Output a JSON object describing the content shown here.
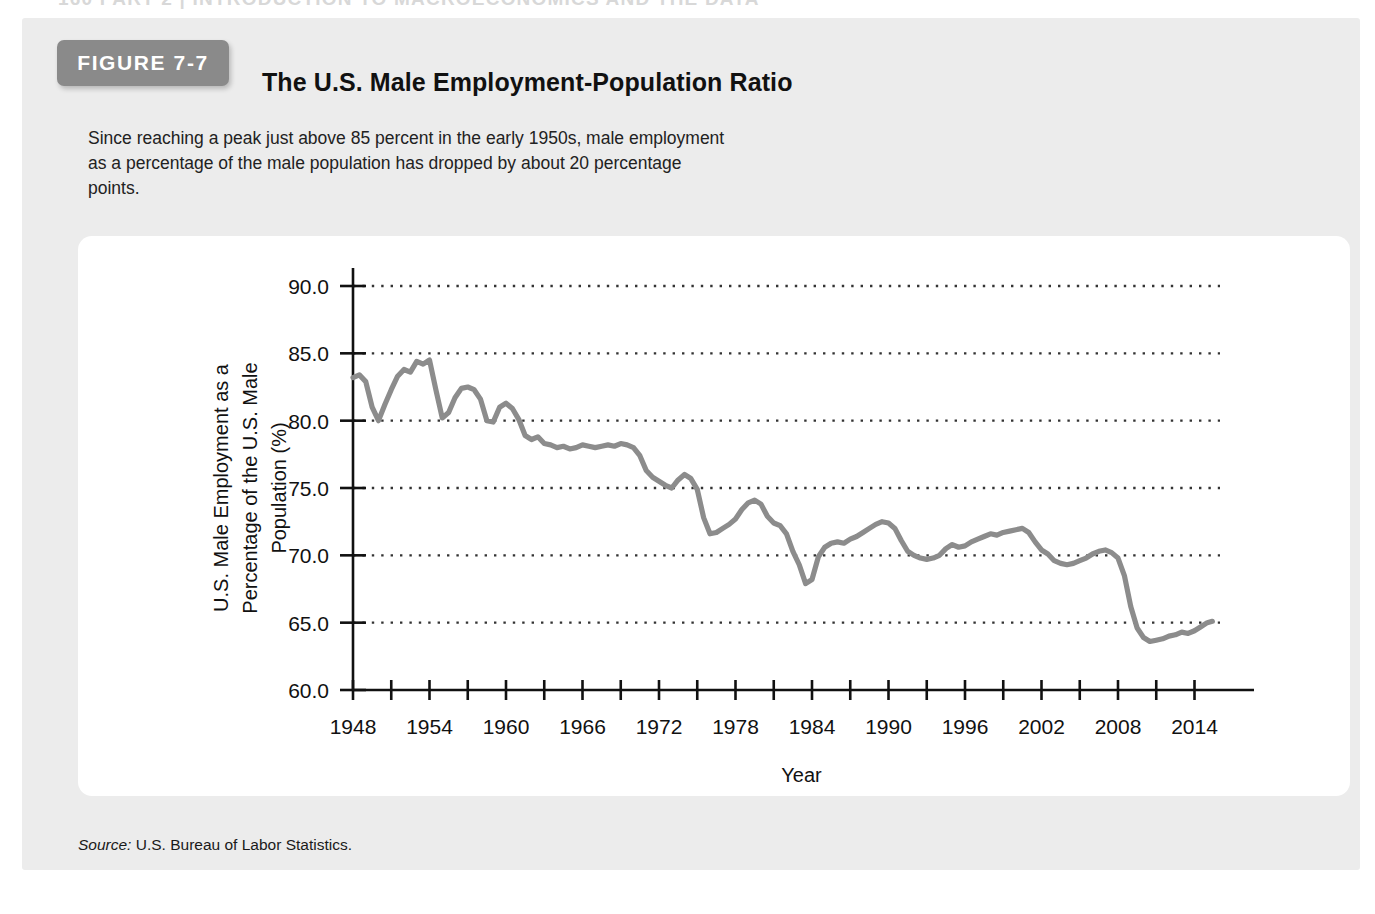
{
  "running_head": "160   PART 2  |  INTRODUCTION TO MACROECONOMICS AND THE DATA",
  "figure": {
    "badge_label": "FIGURE 7-7",
    "title": "The U.S. Male Employment-Population Ratio",
    "caption": "Since reaching a peak just above 85 percent in the early 1950s, male employment as a percentage of the male population has dropped by about 20 percentage points.",
    "source_word": "Source:",
    "source_text": " U.S. Bureau of Labor Statistics."
  },
  "colors": {
    "panel_background": "#ececec",
    "badge": "#8a8a8a",
    "card": "#ffffff",
    "line": "#8c8c8c",
    "axis": "#111111",
    "gridline": "#333333"
  },
  "chart_data": {
    "type": "line",
    "title": "The U.S. Male Employment-Population Ratio",
    "xlabel": "Year",
    "ylabel": "U.S. Male Employment as a Percentage of the U.S. Male Population (%)",
    "ylabel_lines": [
      "U.S. Male Employment as a",
      "Percentage of the U.S. Male",
      "Population (%)"
    ],
    "xlim": [
      1948,
      2016
    ],
    "ylim": [
      60.0,
      90.0
    ],
    "yticks": [
      60.0,
      65.0,
      70.0,
      75.0,
      80.0,
      85.0,
      90.0
    ],
    "ytick_labels": [
      "60.0",
      "65.0",
      "70.0",
      "75.0",
      "80.0",
      "85.0",
      "90.0"
    ],
    "xticks_major": [
      1948,
      1954,
      1960,
      1966,
      1972,
      1978,
      1984,
      1990,
      1996,
      2002,
      2008,
      2014
    ],
    "xtick_labels": [
      "1948",
      "1954",
      "1960",
      "1966",
      "1972",
      "1978",
      "1984",
      "1990",
      "1996",
      "2002",
      "2008",
      "2014"
    ],
    "xticks_minor_step": 3,
    "grid": "horizontal-dotted",
    "legend": "none",
    "series": [
      {
        "name": "U.S. Male Employment-Population Ratio",
        "color": "#8c8c8c",
        "x": [
          1948.0,
          1948.5,
          1949.0,
          1949.5,
          1950.0,
          1950.5,
          1951.0,
          1951.5,
          1952.0,
          1952.5,
          1953.0,
          1953.5,
          1954.0,
          1954.5,
          1955.0,
          1955.5,
          1956.0,
          1956.5,
          1957.0,
          1957.5,
          1958.0,
          1958.5,
          1959.0,
          1959.5,
          1960.0,
          1960.5,
          1961.0,
          1961.5,
          1962.0,
          1962.5,
          1963.0,
          1963.5,
          1964.0,
          1964.5,
          1965.0,
          1965.5,
          1966.0,
          1966.5,
          1967.0,
          1967.5,
          1968.0,
          1968.5,
          1969.0,
          1969.5,
          1970.0,
          1970.5,
          1971.0,
          1971.5,
          1972.0,
          1972.5,
          1973.0,
          1973.5,
          1974.0,
          1974.5,
          1975.0,
          1975.5,
          1976.0,
          1976.5,
          1977.0,
          1977.5,
          1978.0,
          1978.5,
          1979.0,
          1979.5,
          1980.0,
          1980.5,
          1981.0,
          1981.5,
          1982.0,
          1982.5,
          1983.0,
          1983.5,
          1984.0,
          1984.5,
          1985.0,
          1985.5,
          1986.0,
          1986.5,
          1987.0,
          1987.5,
          1988.0,
          1988.5,
          1989.0,
          1989.5,
          1990.0,
          1990.5,
          1991.0,
          1991.5,
          1992.0,
          1992.5,
          1993.0,
          1993.5,
          1994.0,
          1994.5,
          1995.0,
          1995.5,
          1996.0,
          1996.5,
          1997.0,
          1997.5,
          1998.0,
          1998.5,
          1999.0,
          1999.5,
          2000.0,
          2000.5,
          2001.0,
          2001.5,
          2002.0,
          2002.5,
          2003.0,
          2003.5,
          2004.0,
          2004.5,
          2005.0,
          2005.5,
          2006.0,
          2006.5,
          2007.0,
          2007.5,
          2008.0,
          2008.5,
          2009.0,
          2009.5,
          2010.0,
          2010.5,
          2011.0,
          2011.5,
          2012.0,
          2012.5,
          2013.0,
          2013.5,
          2014.0,
          2014.5,
          2015.0,
          2015.4
        ],
        "y": [
          83.2,
          83.4,
          82.9,
          81.0,
          80.0,
          81.2,
          82.3,
          83.3,
          83.8,
          83.6,
          84.4,
          84.2,
          84.5,
          82.3,
          80.2,
          80.6,
          81.7,
          82.4,
          82.5,
          82.3,
          81.6,
          80.0,
          79.9,
          81.0,
          81.3,
          80.9,
          80.1,
          78.9,
          78.6,
          78.8,
          78.3,
          78.2,
          78.0,
          78.1,
          77.9,
          78.0,
          78.2,
          78.1,
          78.0,
          78.1,
          78.2,
          78.1,
          78.3,
          78.2,
          78.0,
          77.4,
          76.3,
          75.8,
          75.5,
          75.2,
          75.0,
          75.6,
          76.0,
          75.7,
          74.9,
          72.8,
          71.6,
          71.7,
          72.0,
          72.3,
          72.7,
          73.4,
          73.9,
          74.1,
          73.8,
          72.9,
          72.4,
          72.2,
          71.6,
          70.3,
          69.3,
          67.9,
          68.2,
          69.9,
          70.6,
          70.9,
          71.0,
          70.9,
          71.2,
          71.4,
          71.7,
          72.0,
          72.3,
          72.5,
          72.4,
          72.0,
          71.1,
          70.3,
          70.0,
          69.8,
          69.7,
          69.8,
          70.0,
          70.5,
          70.8,
          70.6,
          70.7,
          71.0,
          71.2,
          71.4,
          71.6,
          71.5,
          71.7,
          71.8,
          71.9,
          72.0,
          71.7,
          71.0,
          70.4,
          70.1,
          69.6,
          69.4,
          69.3,
          69.4,
          69.6,
          69.8,
          70.1,
          70.3,
          70.4,
          70.2,
          69.8,
          68.5,
          66.2,
          64.6,
          63.9,
          63.6,
          63.7,
          63.8,
          64.0,
          64.1,
          64.3,
          64.2,
          64.4,
          64.7,
          65.0,
          65.1
        ]
      }
    ]
  }
}
